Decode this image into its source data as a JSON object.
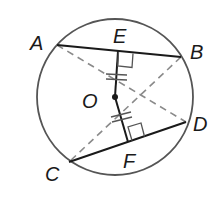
{
  "diagram": {
    "type": "circle-chords",
    "colors": {
      "circle": "#555555",
      "chord": "#1a1a1a",
      "dashed": "#8a8a8a",
      "text": "#1a1a1a"
    },
    "circle": {
      "center_label": "O"
    },
    "points": {
      "A": {
        "label": "A"
      },
      "B": {
        "label": "B"
      },
      "C": {
        "label": "C"
      },
      "D": {
        "label": "D"
      },
      "E": {
        "label": "E"
      },
      "F": {
        "label": "F"
      },
      "O": {
        "label": "O"
      }
    },
    "chords": [
      "AB",
      "CD"
    ],
    "perpendiculars": [
      "OE ⊥ AB",
      "OF ⊥ CD"
    ],
    "dashed_segments": [
      "AD",
      "BC"
    ],
    "congruence_marks": "OE ≅ OF (double tick marks)"
  }
}
